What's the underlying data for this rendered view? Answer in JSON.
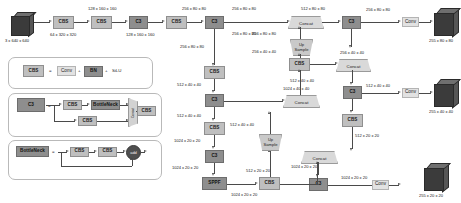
{
  "diagram": {
    "blocks": {
      "cbs": "CBS",
      "c3": "C3",
      "sppf": "SPPF",
      "conv": "Conv",
      "concat": "Concat",
      "upsample_line1": "Up",
      "upsample_line2": "Sample",
      "bn": "BN",
      "silu": "SiLU",
      "bottleneck": "BottleNeck",
      "add": "add"
    },
    "backbone": {
      "input_tensor": "3 x 640 x 640",
      "t_cbs1_out": "64 x 320 x 320",
      "t_cbs2_out": "128 x 160 x 160",
      "t_c3_1_out": "128 x 160 x 160",
      "t_cbs3_out": "256 x 80 x 80",
      "t_c3_2_out": "256 x 80 x 80",
      "t_c3_2_skip": "256 x 80 x 80",
      "t_cbs4_out": "512 x 40 x 40",
      "t_c3_3_out": "512 x 40 x 40",
      "t_c3_3_skip": "512 x 40 x 40",
      "t_cbs5_out": "1024 x 20 x 20",
      "t_c3_4_out": "1024 x 20 x 20",
      "t_sppf_out": "1024 x 20 x 20"
    },
    "neck": {
      "t_cbs_p5": "512 x 20 x 20",
      "t_up1_out": "512 x 40 x 40",
      "t_concat1_out": "1024 x 40 x 40",
      "t_c3_n1_out": "512 x 40 x 40",
      "t_cbs_p4": "256 x 40 x 40",
      "t_up2_out": "256 x 80 x 80",
      "t_concat2_out": "512 x 80 x 80",
      "t_c3_n2_out": "256 x 80 x 80",
      "t_down1_out": "256 x 40 x 40",
      "t_concat3_out": "512 x 40 x 40",
      "t_c3_n3_out": "512 x 40 x 40",
      "t_down2_out": "512 x 20 x 20",
      "t_concat4_out": "1024 x 20 x 20",
      "t_c3_n4_out": "1024 x 20 x 20"
    },
    "heads": {
      "head_large_in": "256 x 80 x 80",
      "head_large_out": "255 x 80 x 80",
      "head_mid_in": "512 x 40 x 40",
      "head_mid_out": "255 x 40 x 40",
      "head_small_in": "1024 x 20 x 20",
      "head_small_out": "255 x 20 x 20"
    },
    "legend": {
      "eq": "=",
      "plus": "+",
      "cbs_def": {
        "name": "CBS",
        "parts": [
          "Conv",
          "BN",
          "SiLU"
        ]
      },
      "c3_def": {
        "name": "C3",
        "branch_top": [
          "CBS",
          "BottleNeck"
        ],
        "branch_bottom": [
          "CBS"
        ],
        "merge": "Concat",
        "out": "CBS"
      },
      "bottleneck_def": {
        "name": "BottleNeck",
        "parts": [
          "CBS",
          "CBS"
        ],
        "merge": "add"
      }
    }
  }
}
